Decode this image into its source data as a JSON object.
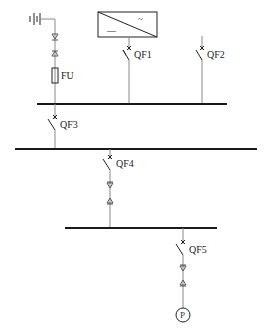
{
  "diagram": {
    "labels": {
      "fuse": "FU",
      "qf1": "QF1",
      "qf2": "QF2",
      "qf3": "QF3",
      "qf4": "QF4",
      "qf5": "QF5",
      "pump": "P",
      "inverter_ac": "~",
      "inverter_dc": "—"
    },
    "buses": [
      {
        "id": "bus-1",
        "x1": 37,
        "x2": 227,
        "y": 104
      },
      {
        "id": "bus-2",
        "x1": 15,
        "x2": 257,
        "y": 149
      },
      {
        "id": "bus-3",
        "x1": 65,
        "x2": 217,
        "y": 228
      }
    ],
    "components": [
      {
        "type": "battery",
        "x": 28,
        "y": 13
      },
      {
        "type": "connector",
        "x": 55,
        "y": 36
      },
      {
        "type": "fuse",
        "label": "FU",
        "x": 55,
        "y": 70
      },
      {
        "type": "inverter",
        "x": 98,
        "y": 12,
        "w": 59,
        "h": 25
      },
      {
        "type": "breaker",
        "label": "QF1",
        "x": 129,
        "y": 48
      },
      {
        "type": "breaker",
        "label": "QF2",
        "x": 202,
        "y": 48
      },
      {
        "type": "breaker",
        "label": "QF3",
        "x": 55,
        "y": 117
      },
      {
        "type": "breaker",
        "label": "QF4",
        "x": 110,
        "y": 157
      },
      {
        "type": "breaker",
        "label": "QF5",
        "x": 183,
        "y": 242
      },
      {
        "type": "pump",
        "label": "P",
        "x": 183,
        "y": 315,
        "r": 7
      }
    ],
    "colors": {
      "bus": "#1a1a1a",
      "wire": "#8a8a8a",
      "background": "#ffffff"
    }
  }
}
